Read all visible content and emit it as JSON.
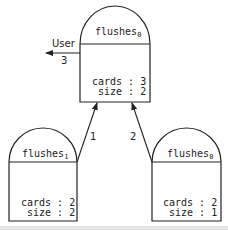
{
  "diagram": {
    "nodes": [
      {
        "id": "top",
        "name": "flushes",
        "subscript": "0",
        "fields": [
          {
            "label": "cards : 3"
          },
          {
            "label": " size : 2"
          }
        ]
      },
      {
        "id": "left",
        "name": "flushes",
        "subscript": "1",
        "fields": [
          {
            "label": "cards : 2"
          },
          {
            "label": " size : 2"
          }
        ]
      },
      {
        "id": "right",
        "name": "flushes",
        "subscript": "0",
        "fields": [
          {
            "label": "cards : 2"
          },
          {
            "label": " size : 1"
          }
        ]
      }
    ],
    "edges": [
      {
        "from": "left",
        "to": "top",
        "label": "1"
      },
      {
        "from": "right",
        "to": "top",
        "label": "2"
      },
      {
        "from": "top",
        "to": "user",
        "label": "3"
      }
    ],
    "user_label": "User"
  }
}
